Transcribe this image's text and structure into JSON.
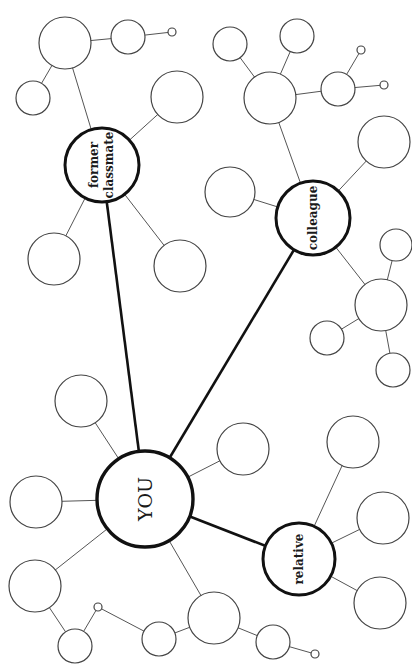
{
  "diagram": {
    "type": "social-network-mind-map",
    "orientation": "rotated-90",
    "center": {
      "id": "you",
      "label": "YOU",
      "x": 145,
      "y": 499,
      "r": 48
    },
    "hubs": [
      {
        "id": "former-classmate",
        "label_lines": [
          "former",
          "classmate"
        ],
        "x": 102,
        "y": 165,
        "r": 37
      },
      {
        "id": "colleague",
        "label_lines": [
          "colleague"
        ],
        "x": 313,
        "y": 218,
        "r": 37
      },
      {
        "id": "relative",
        "label_lines": [
          "relative"
        ],
        "x": 299,
        "y": 559,
        "r": 36
      }
    ],
    "nodes": [
      {
        "id": "n1",
        "x": 65,
        "y": 43,
        "r": 26
      },
      {
        "id": "n2",
        "x": 128,
        "y": 37,
        "r": 17
      },
      {
        "id": "n3",
        "x": 172,
        "y": 32,
        "r": 4
      },
      {
        "id": "n4",
        "x": 33,
        "y": 98,
        "r": 17
      },
      {
        "id": "n5",
        "x": 177,
        "y": 97,
        "r": 26
      },
      {
        "id": "n6",
        "x": 54,
        "y": 259,
        "r": 26
      },
      {
        "id": "n7",
        "x": 180,
        "y": 266,
        "r": 26
      },
      {
        "id": "n8",
        "x": 230,
        "y": 44,
        "r": 17
      },
      {
        "id": "n9",
        "x": 297,
        "y": 36,
        "r": 17
      },
      {
        "id": "n10",
        "x": 270,
        "y": 98,
        "r": 26
      },
      {
        "id": "n11",
        "x": 338,
        "y": 89,
        "r": 17
      },
      {
        "id": "n12",
        "x": 361,
        "y": 50,
        "r": 4
      },
      {
        "id": "n13",
        "x": 384,
        "y": 85,
        "r": 4
      },
      {
        "id": "n14",
        "x": 384,
        "y": 142,
        "r": 26
      },
      {
        "id": "n15",
        "x": 230,
        "y": 192,
        "r": 25
      },
      {
        "id": "n16",
        "x": 396,
        "y": 245,
        "r": 16
      },
      {
        "id": "n17",
        "x": 381,
        "y": 305,
        "r": 26
      },
      {
        "id": "n18",
        "x": 327,
        "y": 338,
        "r": 17
      },
      {
        "id": "n19",
        "x": 393,
        "y": 370,
        "r": 17
      },
      {
        "id": "n20",
        "x": 81,
        "y": 401,
        "r": 26
      },
      {
        "id": "n21",
        "x": 243,
        "y": 449,
        "r": 26
      },
      {
        "id": "n22",
        "x": 36,
        "y": 502,
        "r": 26
      },
      {
        "id": "n23",
        "x": 35,
        "y": 586,
        "r": 26
      },
      {
        "id": "n24",
        "x": 75,
        "y": 646,
        "r": 17
      },
      {
        "id": "n25",
        "x": 98,
        "y": 607,
        "r": 4
      },
      {
        "id": "n26",
        "x": 159,
        "y": 639,
        "r": 17
      },
      {
        "id": "n27",
        "x": 214,
        "y": 618,
        "r": 26
      },
      {
        "id": "n28",
        "x": 273,
        "y": 642,
        "r": 17
      },
      {
        "id": "n29",
        "x": 315,
        "y": 654,
        "r": 4
      },
      {
        "id": "n30",
        "x": 353,
        "y": 442,
        "r": 26
      },
      {
        "id": "n31",
        "x": 383,
        "y": 518,
        "r": 26
      },
      {
        "id": "n32",
        "x": 380,
        "y": 603,
        "r": 26
      }
    ],
    "edges_thick": [
      [
        "you",
        "former-classmate"
      ],
      [
        "you",
        "colleague"
      ],
      [
        "you",
        "relative"
      ]
    ],
    "edges_thin": [
      [
        "former-classmate",
        "n1"
      ],
      [
        "n1",
        "n2"
      ],
      [
        "n2",
        "n3"
      ],
      [
        "n1",
        "n4"
      ],
      [
        "former-classmate",
        "n5"
      ],
      [
        "former-classmate",
        "n6"
      ],
      [
        "former-classmate",
        "n7"
      ],
      [
        "colleague",
        "n10"
      ],
      [
        "n10",
        "n8"
      ],
      [
        "n10",
        "n9"
      ],
      [
        "n10",
        "n11"
      ],
      [
        "n11",
        "n12"
      ],
      [
        "n11",
        "n13"
      ],
      [
        "colleague",
        "n14"
      ],
      [
        "colleague",
        "n15"
      ],
      [
        "colleague",
        "n17"
      ],
      [
        "n17",
        "n16"
      ],
      [
        "n17",
        "n18"
      ],
      [
        "n17",
        "n19"
      ],
      [
        "you",
        "n20"
      ],
      [
        "you",
        "n21"
      ],
      [
        "you",
        "n22"
      ],
      [
        "you",
        "n23"
      ],
      [
        "you",
        "n27"
      ],
      [
        "n23",
        "n24"
      ],
      [
        "n24",
        "n25"
      ],
      [
        "n25",
        "n26"
      ],
      [
        "n26",
        "n27"
      ],
      [
        "n27",
        "n28"
      ],
      [
        "n28",
        "n29"
      ],
      [
        "relative",
        "n30"
      ],
      [
        "relative",
        "n31"
      ],
      [
        "relative",
        "n32"
      ]
    ]
  },
  "labels": {
    "you": "YOU",
    "former_line1": "former",
    "former_line2": "classmate",
    "colleague": "colleague",
    "relative": "relative"
  }
}
